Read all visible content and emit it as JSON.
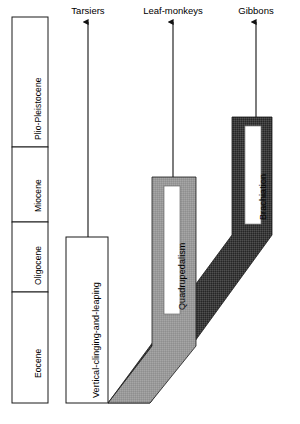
{
  "diagram": {
    "type": "evolutionary-schematic"
  },
  "timescale": {
    "name": "geological-epochs",
    "orientation": "vertical-oldest-at-bottom",
    "epochs": [
      {
        "label": "Plio-Pleistocene",
        "order": 4
      },
      {
        "label": "Miocene",
        "order": 3
      },
      {
        "label": "Oligocene",
        "order": 2
      },
      {
        "label": "Eocene",
        "order": 1
      }
    ]
  },
  "lineages": [
    {
      "label": "Tarsiers"
    },
    {
      "label": "Leaf-monkeys"
    },
    {
      "label": "Gibbons"
    }
  ],
  "locomotion_modes": [
    {
      "label": "Vertical-clinging-and-leaping",
      "fill": "#ffffff"
    },
    {
      "label": "Quadrupedalism",
      "fill": "#9a9a9a"
    },
    {
      "label": "Brachiation",
      "fill": "#3b3b3b"
    }
  ],
  "colors": {
    "outline": "#1a1a1a",
    "light_gray": "#9a9a9a",
    "dark_gray": "#3b3b3b",
    "white": "#ffffff",
    "background": "#ffffff"
  }
}
